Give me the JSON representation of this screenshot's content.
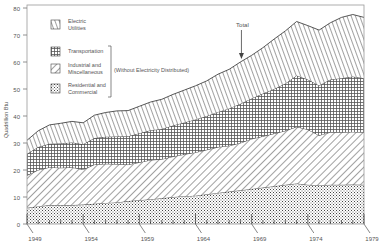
{
  "chart_data": {
    "type": "area",
    "stacked": true,
    "title": "",
    "xlabel": "",
    "ylabel": "Quadrillion Btu",
    "xlim": [
      1949,
      1979
    ],
    "ylim": [
      0,
      80
    ],
    "x_ticks": [
      "1949",
      "1954",
      "1959",
      "1964",
      "1969",
      "1974",
      "1979"
    ],
    "y_ticks": [
      "0",
      "10",
      "20",
      "30",
      "40",
      "50",
      "60",
      "70",
      "80"
    ],
    "x": [
      1949,
      1950,
      1951,
      1952,
      1953,
      1954,
      1955,
      1956,
      1957,
      1958,
      1959,
      1960,
      1961,
      1962,
      1963,
      1964,
      1965,
      1966,
      1967,
      1968,
      1969,
      1970,
      1971,
      1972,
      1973,
      1974,
      1975,
      1976,
      1977,
      1978,
      1979
    ],
    "series": [
      {
        "name": "Residential and Commercial",
        "pattern": "dots",
        "values": [
          6.0,
          6.5,
          7.0,
          7.0,
          7.0,
          7.2,
          7.5,
          7.8,
          8.0,
          8.5,
          8.8,
          9.2,
          9.5,
          10.0,
          10.3,
          10.5,
          11.0,
          11.5,
          12.0,
          12.5,
          13.0,
          13.5,
          14.0,
          14.5,
          15.0,
          14.5,
          14.3,
          14.5,
          14.5,
          14.6,
          14.5
        ]
      },
      {
        "name": "Industrial and Miscellaneous",
        "pattern": "diagonal-hatch",
        "values": [
          12.0,
          13.5,
          14.0,
          13.8,
          14.0,
          13.0,
          14.5,
          14.5,
          14.2,
          13.5,
          14.0,
          14.5,
          14.5,
          15.0,
          15.5,
          16.0,
          16.5,
          17.0,
          17.0,
          17.5,
          18.5,
          19.0,
          19.5,
          20.0,
          21.0,
          20.5,
          18.5,
          19.5,
          19.5,
          19.5,
          19.5
        ]
      },
      {
        "name": "Transportation",
        "pattern": "grid",
        "values": [
          8.0,
          8.5,
          8.7,
          9.0,
          9.2,
          9.3,
          9.8,
          10.0,
          10.2,
          10.5,
          10.8,
          11.0,
          11.2,
          11.5,
          11.8,
          12.2,
          12.5,
          13.0,
          13.8,
          14.5,
          15.0,
          15.8,
          16.5,
          17.5,
          19.0,
          18.5,
          18.5,
          19.5,
          20.0,
          20.5,
          20.0
        ]
      },
      {
        "name": "Electric Utilities",
        "pattern": "vertical-hatch",
        "values": [
          5.0,
          6.0,
          7.0,
          7.5,
          7.8,
          8.0,
          8.5,
          9.0,
          9.5,
          9.5,
          10.0,
          10.5,
          11.0,
          11.5,
          12.0,
          12.5,
          13.0,
          14.0,
          14.5,
          15.5,
          16.0,
          17.0,
          18.5,
          19.5,
          20.0,
          20.0,
          20.5,
          21.0,
          22.5,
          23.0,
          22.5
        ]
      }
    ],
    "totals": [
      31.0,
      34.5,
      36.7,
      37.3,
      38.0,
      37.5,
      40.3,
      41.3,
      41.9,
      42.0,
      43.6,
      45.2,
      46.2,
      48.0,
      49.6,
      51.2,
      53.0,
      55.5,
      57.3,
      60.0,
      62.5,
      65.3,
      68.5,
      71.5,
      75.0,
      73.5,
      71.8,
      74.5,
      76.5,
      77.6,
      76.5
    ],
    "legend": [
      {
        "label": "Electric Utilities",
        "pattern": "vertical-hatch"
      },
      {
        "label": "Transportation",
        "pattern": "grid"
      },
      {
        "label": "Industrial and Miscellaneous",
        "pattern": "diagonal-hatch"
      },
      {
        "label": "Residential and Commercial",
        "pattern": "dots"
      }
    ],
    "legend_bracket_note": "(Without Electricity Distributed)",
    "annotations": [
      {
        "text": "Total",
        "x": 1968,
        "arrow": true
      }
    ],
    "legend_position": "upper-left",
    "grid": false
  },
  "labels": {
    "ylabel": "Quadrillion Btu",
    "total": "Total",
    "bracket_note": "(Without Electricity Distributed)",
    "legend_0a": "Electric",
    "legend_0b": "Utilities",
    "legend_1": "Transportation",
    "legend_2a": "Industrial and",
    "legend_2b": "Miscellaneous",
    "legend_3a": "Residential and",
    "legend_3b": "Commercial"
  }
}
